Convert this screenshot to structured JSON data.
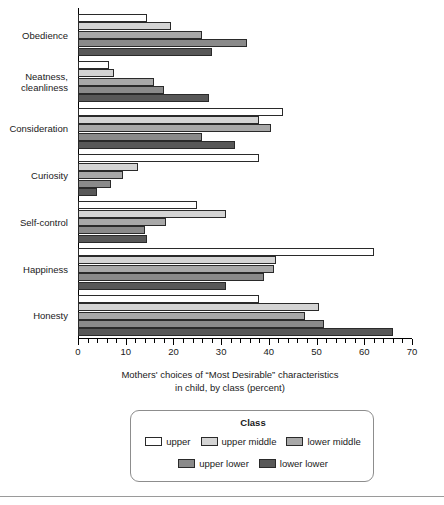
{
  "chart_data": {
    "type": "bar",
    "orientation": "horizontal",
    "title": "",
    "xlabel": "Mothers' choices of “Most Desirable” characteristics\nin child, by class (percent)",
    "xlabel_line1": "Mothers' choices of “Most Desirable” characteristics",
    "xlabel_line2": "in child, by class (percent)",
    "ylabel": "",
    "xlim": [
      0,
      70
    ],
    "xticks": [
      0,
      10,
      20,
      30,
      40,
      50,
      60,
      70
    ],
    "xtick_labels": [
      "0",
      "10",
      "20",
      "30",
      "40",
      "50",
      "60",
      "70"
    ],
    "minor_tick_step": 2,
    "grid": false,
    "legend_position": "bottom",
    "legend_title": "Class",
    "categories": [
      "Obedience",
      "Neatness,\ncleanliness",
      "Consideration",
      "Curiosity",
      "Self-control",
      "Happiness",
      "Honesty"
    ],
    "series": [
      {
        "name": "upper",
        "color": "#ffffff",
        "values": [
          14.5,
          6.5,
          43,
          38,
          25,
          62,
          38
        ]
      },
      {
        "name": "upper middle",
        "color": "#d4d4d4",
        "values": [
          19.5,
          7.5,
          38,
          12.5,
          31,
          41.5,
          50.5
        ]
      },
      {
        "name": "lower middle",
        "color": "#a8a8a8",
        "values": [
          26,
          16,
          40.5,
          9.5,
          18.5,
          41,
          47.5
        ]
      },
      {
        "name": "upper lower",
        "color": "#8a8a8a",
        "values": [
          35.5,
          18,
          26,
          7,
          14,
          39,
          51.5
        ]
      },
      {
        "name": "lower lower",
        "color": "#585858",
        "values": [
          28,
          27.5,
          33,
          4,
          14.5,
          31,
          66
        ]
      }
    ]
  },
  "legend": {
    "title": "Class",
    "items": [
      {
        "label": "upper",
        "color": "#ffffff"
      },
      {
        "label": "upper middle",
        "color": "#d4d4d4"
      },
      {
        "label": "lower middle",
        "color": "#a8a8a8"
      },
      {
        "label": "upper lower",
        "color": "#8a8a8a"
      },
      {
        "label": "lower lower",
        "color": "#585858"
      }
    ]
  }
}
